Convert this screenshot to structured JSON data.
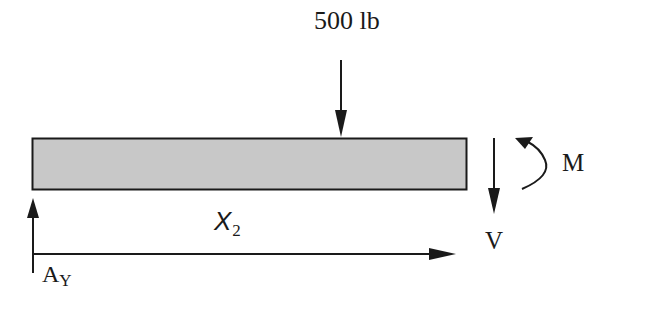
{
  "diagram": {
    "type": "free-body diagram (beam section)",
    "load": {
      "label": "500 lb",
      "direction": "down"
    },
    "internal_moment": {
      "label": "M",
      "direction": "counterclockwise"
    },
    "internal_shear": {
      "label": "V",
      "direction": "down"
    },
    "position": {
      "symbol": "X",
      "subscript": "2"
    },
    "reaction": {
      "symbol": "A",
      "subscript": "Y",
      "direction": "up"
    },
    "colors": {
      "beam_fill": "#c8c8c8",
      "stroke": "#1a1a1a",
      "background": "#ffffff"
    }
  }
}
